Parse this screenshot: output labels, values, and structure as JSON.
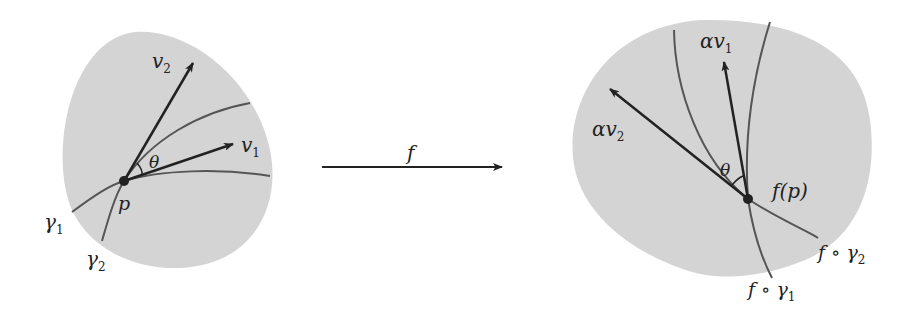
{
  "colors": {
    "region_fill": "#d4d4d4",
    "curve": "#555555",
    "vector": "#222222",
    "text": "#222222",
    "background": "#ffffff"
  },
  "left_diagram": {
    "point_label": "p",
    "curve_labels": [
      {
        "base": "γ",
        "sub": "1"
      },
      {
        "base": "γ",
        "sub": "2"
      }
    ],
    "vector_labels": [
      {
        "base": "v",
        "sub": "1"
      },
      {
        "base": "v",
        "sub": "2"
      }
    ],
    "angle_label": "θ"
  },
  "map_arrow": {
    "label": "f"
  },
  "right_diagram": {
    "point_label": "f(p)",
    "curve_labels": [
      {
        "base": "f ∘ γ",
        "sub": "1"
      },
      {
        "base": "f ∘ γ",
        "sub": "2"
      }
    ],
    "vector_labels": [
      {
        "base": "αv",
        "sub": "1"
      },
      {
        "base": "αv",
        "sub": "2"
      }
    ],
    "angle_label": "θ"
  }
}
